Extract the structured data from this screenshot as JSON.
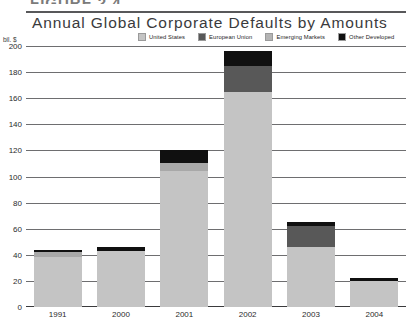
{
  "figure": {
    "label": "FIGURE 2.4"
  },
  "header": {
    "title": "Annual Global Corporate Defaults by Amounts"
  },
  "chart_data": {
    "type": "bar",
    "subtype": "stacked-bar",
    "title": "Annual Global Corporate Defaults by Amounts",
    "xlabel": "",
    "ylabel": "bil. $",
    "unit_label": "bil. $",
    "categories": [
      "1991",
      "2000",
      "2001",
      "2002",
      "2003",
      "2004"
    ],
    "ylim": [
      0,
      200
    ],
    "yticks": [
      0,
      20,
      40,
      60,
      80,
      100,
      120,
      140,
      160,
      180,
      200
    ],
    "ytick_labels": [
      "0",
      "20",
      "40",
      "60",
      "80",
      "100",
      "120",
      "140",
      "160",
      "180",
      "200"
    ],
    "grid": true,
    "legend_position": "top",
    "series": [
      {
        "name": "United States",
        "color": "#c4c4c4",
        "values": [
          38,
          43,
          104,
          165,
          46,
          20
        ]
      },
      {
        "name": "European Union",
        "color": "#585858",
        "values": [
          0,
          0,
          0,
          20,
          16,
          0
        ]
      },
      {
        "name": "Emerging Markets",
        "color": "#a8a8a8",
        "values": [
          4,
          0,
          6,
          0,
          0,
          0
        ]
      },
      {
        "name": "Other Developed",
        "color": "#101010",
        "values": [
          2,
          3,
          10,
          11,
          3,
          2
        ]
      }
    ],
    "totals": [
      44,
      46,
      120,
      196,
      65,
      22
    ]
  },
  "legend": {
    "items": [
      {
        "label": "United States",
        "color": "#c4c4c4"
      },
      {
        "label": "European Union",
        "color": "#585858"
      },
      {
        "label": "Emerging Markets",
        "color": "#b4b4b4"
      },
      {
        "label": "Other Developed",
        "color": "#101010"
      }
    ]
  }
}
